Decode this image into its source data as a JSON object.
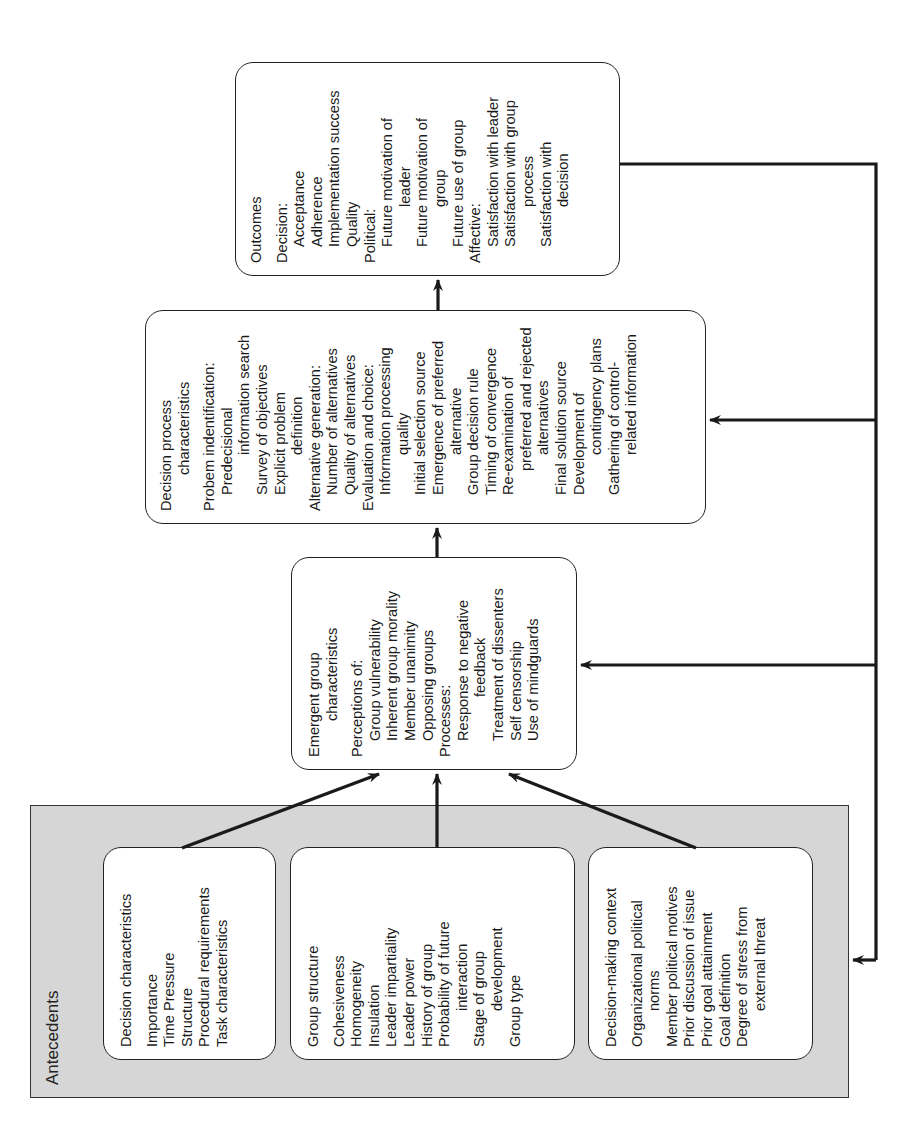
{
  "antecedents": {
    "label": "Antecedents",
    "decision_characteristics": {
      "title": "Decision characteristics",
      "items": [
        "Importance",
        "Time Pressure",
        "Structure",
        "Procedural requirements",
        "Task characteristics"
      ]
    },
    "group_structure": {
      "title": "Group structure",
      "items": [
        "Cohesiveness",
        "Homogeneity",
        "Insulation",
        "Leader impartiality",
        "Leader power",
        "History of group",
        "Probability of future",
        "interaction",
        "Stage of group",
        "development",
        "Group type"
      ]
    },
    "decision_making_context": {
      "title": "Decision-making context",
      "items": [
        "Organizational political",
        "norms",
        "Member political motives",
        "Prior discussion of issue",
        "Prior goal attainment",
        "Goal definition",
        "Degree of stress from",
        "external threat"
      ]
    }
  },
  "emergent": {
    "title_1": "Emergent group",
    "title_2": "characteristics",
    "perceptions_label": "Perceptions of:",
    "perceptions": [
      "Group vulnerability",
      "Inherent group morality",
      "Member unanimity",
      "Opposing groups"
    ],
    "processes_label": "Processes:",
    "processes": [
      "Response to negative",
      "feedback",
      "Treatment of dissenters",
      "Self censorship",
      "Use of mindguards"
    ]
  },
  "decision_process": {
    "title_1": "Decision process",
    "title_2": "characteristics",
    "problem_label": "Probem indentification:",
    "problem": [
      "Predecisional",
      "information search",
      "Survey of objectives",
      "Explicit problem",
      "definition"
    ],
    "alternative_label": "Alternative generation:",
    "alternative": [
      "Number of alternatives",
      "Quality of alternatives"
    ],
    "evaluation_label": "Evaluation and choice:",
    "evaluation": [
      "Information processing",
      "quality",
      "Initial selection source",
      "Emergence of preferred",
      "alternative",
      "Group decision rule",
      "Timing of convergence",
      "Re-examination of",
      "preferred and rejected",
      "alternatives",
      "Final solution source",
      "Development of",
      "contingency plans",
      "Gathering of control-",
      "related information"
    ]
  },
  "outcomes": {
    "title": "Outcomes",
    "decision_label": "Decision:",
    "decision": [
      "Acceptance",
      "Adherence",
      "Implementation success",
      "Quality"
    ],
    "political_label": "Political:",
    "political": [
      "Future motivation of",
      "leader",
      "Future motivation of",
      "group",
      "Future use of group"
    ],
    "affective_label": "Affective:",
    "affective": [
      "Satisfaction with leader",
      "Satisfaction with group",
      "process",
      "Satisfaction with",
      "decision"
    ]
  },
  "colors": {
    "antecedents_fill": "#d6d6d6",
    "box_fill": "#ffffff",
    "stroke": "#1a1a1a"
  }
}
